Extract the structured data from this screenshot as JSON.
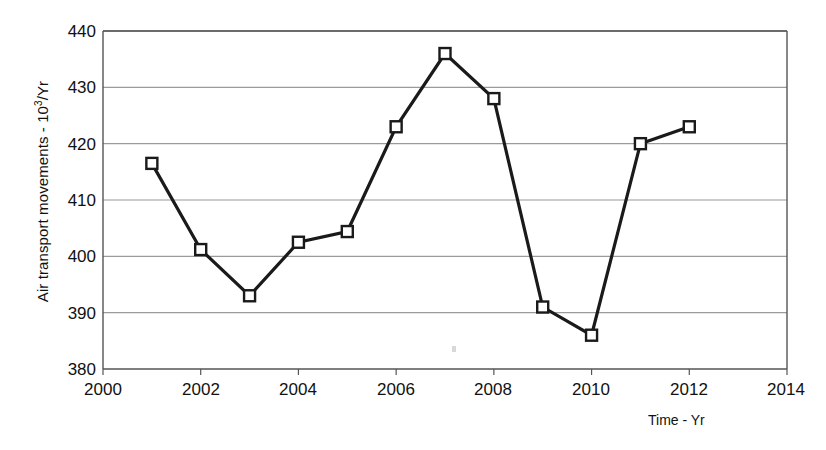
{
  "chart_data": {
    "type": "line",
    "title": "",
    "subtitle": "",
    "xlabel": "Time - Yr",
    "ylabel": "Air transport movements - 10³/Yr",
    "ylabel_base": "Air transport movements - 10",
    "ylabel_exponent": "3",
    "ylabel_suffix": "/Yr",
    "x": [
      2001,
      2002,
      2003,
      2004,
      2005,
      2006,
      2007,
      2008,
      2009,
      2010,
      2011,
      2012
    ],
    "values": [
      416.5,
      401.2,
      393.0,
      402.5,
      404.4,
      423.0,
      436.0,
      428.0,
      391.0,
      386.0,
      420.0,
      423.0
    ],
    "series": [
      {
        "name": "Air transport movements",
        "values": [
          416.5,
          401.2,
          393.0,
          402.5,
          404.4,
          423.0,
          436.0,
          428.0,
          391.0,
          386.0,
          420.0,
          423.0
        ]
      }
    ],
    "xlim": [
      2000,
      2014
    ],
    "ylim": [
      380,
      440
    ],
    "xticks": [
      2000,
      2002,
      2004,
      2006,
      2008,
      2010,
      2012,
      2014
    ],
    "yticks": [
      380,
      390,
      400,
      410,
      420,
      430,
      440
    ],
    "xtick_labels": [
      "2000",
      "2002",
      "2004",
      "2006",
      "2008",
      "2010",
      "2012",
      "2014"
    ],
    "ytick_labels": [
      "380",
      "390",
      "400",
      "410",
      "420",
      "430",
      "440"
    ],
    "grid": "horizontal",
    "legend": "none",
    "marker": "open-square",
    "line_color": "#1a1a1a",
    "grid_color": "#9a9a9a",
    "axis_color": "#555555",
    "marker_fill": "#ffffff",
    "annotations": []
  }
}
